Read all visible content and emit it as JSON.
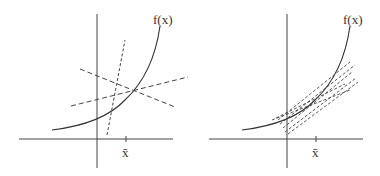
{
  "diagram": {
    "panels": [
      {
        "id": "left",
        "function_label": "f(x)",
        "point_label": "x̄",
        "description": "Convex curve f(x) with three dashed lines crossing near x̄"
      },
      {
        "id": "right",
        "function_label": "f(x)",
        "point_label": "x̄",
        "description": "Convex curve f(x) with a bundle of dashed tangent-like lines near x̄"
      }
    ],
    "colors": {
      "axis": "#444444",
      "curve": "#333333",
      "dashed": "#444444"
    }
  }
}
